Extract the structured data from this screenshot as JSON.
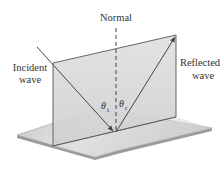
{
  "diagram": {
    "labels": {
      "normal": "Normal",
      "incident_line1": "Incident",
      "incident_line2": "wave",
      "reflected_line1": "Reflected",
      "reflected_line2": "wave",
      "theta_i": "θ",
      "theta_i_sub": "i",
      "theta_r": "θ",
      "theta_r_sub": "r"
    },
    "colors": {
      "background": "#ffffff",
      "plane_fill": "#d9d9d9",
      "plane_edge": "#555555",
      "floor_fill": "#c8c8c8",
      "floor_edge": "#9a9a9a",
      "ray": "#444444",
      "text": "#333333"
    },
    "elements": [
      {
        "name": "vertical-plane",
        "type": "plane"
      },
      {
        "name": "floor-surface",
        "type": "plane"
      },
      {
        "name": "incident-ray",
        "type": "arrow"
      },
      {
        "name": "reflected-ray",
        "type": "arrow"
      },
      {
        "name": "normal-line",
        "type": "dashed-line"
      }
    ]
  }
}
